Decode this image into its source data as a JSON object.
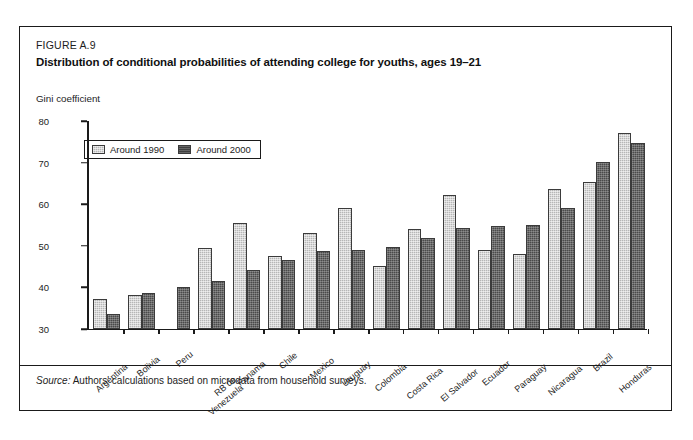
{
  "figure": {
    "number": "FIGURE A.9",
    "title": "Distribution of conditional probabilities of attending college for youths, ages 19–21",
    "source_word": "Source:",
    "source_text": "Authors' calculations based on microdata from household surveys."
  },
  "legend": {
    "items": [
      {
        "label": "Around 1990",
        "color": "#b6b6b6",
        "swatch": "light-hatched-swatch"
      },
      {
        "label": "Around 2000",
        "color": "#3f3f3f",
        "swatch": "dark-hatched-swatch"
      }
    ]
  },
  "chart_data": {
    "type": "bar",
    "title": "Distribution of conditional probabilities of attending college for youths, ages 19–21",
    "xlabel": "",
    "ylabel": "Gini coefficient",
    "ylim": [
      30,
      80
    ],
    "yticks": [
      30,
      40,
      50,
      60,
      70,
      80
    ],
    "grid": false,
    "legend_position": "top-left-inside",
    "categories": [
      "Argentina",
      "Bolivia",
      "Peru",
      "RB de Venezuela",
      "Panama",
      "Chile",
      "Mexico",
      "Uruguay",
      "Colombia",
      "Costa Rica",
      "El Salvador",
      "Ecuador",
      "Paraguay",
      "Nicaragua",
      "Brazil",
      "Honduras"
    ],
    "series": [
      {
        "name": "Around 1990",
        "values": [
          37.3,
          38.2,
          null,
          49.5,
          55.4,
          47.6,
          53.2,
          59.1,
          45.1,
          54.0,
          62.1,
          49.0,
          48.0,
          63.7,
          65.3,
          77.2
        ]
      },
      {
        "name": "Around 2000",
        "values": [
          33.5,
          38.6,
          40.1,
          41.5,
          44.2,
          46.7,
          48.8,
          49.0,
          49.7,
          51.8,
          54.2,
          54.7,
          54.9,
          59.0,
          70.1,
          74.8
        ]
      }
    ]
  }
}
